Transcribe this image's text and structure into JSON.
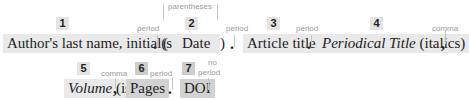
{
  "elements": [
    {
      "number": "1",
      "text": "Author's last name, initial(s)"
    },
    {
      "number": "2",
      "text": "Date"
    },
    {
      "number": "3",
      "text": "Article title"
    },
    {
      "number": "4",
      "text_italic": "Periodical Title",
      "text_suffix": " (italics)"
    },
    {
      "number": "5",
      "text_italic": "Volume",
      "text_suffix": " (issue)"
    },
    {
      "number": "6",
      "text": "Pages"
    },
    {
      "number": "7",
      "text": "DOI"
    }
  ],
  "separators": {
    "after_1": {
      "label": "period",
      "glyph": "."
    },
    "around_2": {
      "label": "parentheses",
      "open": "(",
      "close": ")"
    },
    "after_2": {
      "label": "period",
      "glyph": "."
    },
    "after_3": {
      "label": "period",
      "glyph": "."
    },
    "after_4": {
      "label": "comma",
      "glyph": ","
    },
    "after_5": {
      "label": "comma",
      "glyph": ","
    },
    "after_6": {
      "label": "period",
      "glyph": "."
    },
    "after_7": {
      "label_line1": "no",
      "label_line2": "period"
    }
  }
}
